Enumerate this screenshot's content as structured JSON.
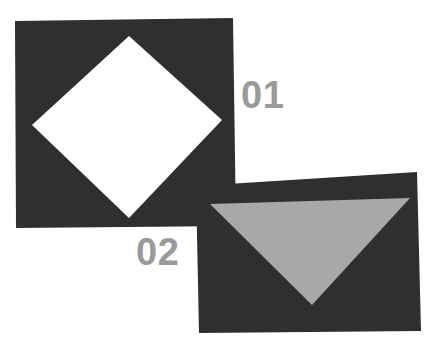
{
  "canvas": {
    "width": 439,
    "height": 350,
    "background_color": "#ffffff"
  },
  "palette": {
    "panel_dark": "#2f2f2f",
    "cutout_white": "#ffffff",
    "triangle_gray": "#a8a8a8",
    "label_gray": "#9a9a9a"
  },
  "panels": [
    {
      "id": "panel-01",
      "label": "01",
      "fill_color": "#2f2f2f",
      "corners": [
        [
          15,
          21
        ],
        [
          233,
          18
        ],
        [
          236,
          226
        ],
        [
          16,
          228
        ]
      ],
      "inner_shape": {
        "kind": "diamond",
        "fill_color": "#ffffff",
        "points": [
          [
            129,
            36
          ],
          [
            222,
            120
          ],
          [
            129,
            218
          ],
          [
            32,
            125
          ]
        ]
      },
      "label_position": [
        241,
        98
      ],
      "label_color": "#9a9a9a",
      "label_font_size": 38
    },
    {
      "id": "panel-02",
      "label": "02",
      "fill_color": "#2f2f2f",
      "corners": [
        [
          196,
          186
        ],
        [
          417,
          172
        ],
        [
          421,
          331
        ],
        [
          199,
          333
        ]
      ],
      "inner_shape": {
        "kind": "triangle",
        "fill_color": "#a8a8a8",
        "points": [
          [
            210,
            204
          ],
          [
            410,
            198
          ],
          [
            312,
            305
          ]
        ]
      },
      "label_position": [
        136,
        255
      ],
      "label_color": "#9a9a9a",
      "label_font_size": 38
    }
  ],
  "labels": [
    {
      "text": "01",
      "color": "#9a9a9a"
    },
    {
      "text": "02",
      "color": "#9a9a9a"
    }
  ]
}
